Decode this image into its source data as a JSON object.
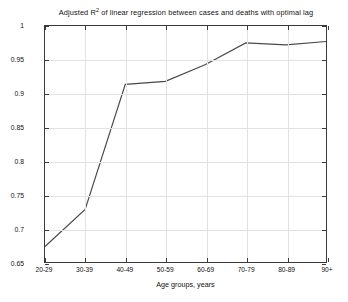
{
  "chart_data": {
    "type": "line",
    "title": "Adjusted R2 of linear regression between cases and deaths with optimal lag",
    "title_prefix": "Adjusted R",
    "title_superscript": "2",
    "title_suffix": " of linear regression between cases and deaths with optimal lag",
    "xlabel": "Age groups, years",
    "ylabel": "",
    "categories": [
      "20-29",
      "30-39",
      "40-49",
      "50-59",
      "60-69",
      "70-79",
      "80-89",
      "90+"
    ],
    "values": [
      0.673,
      0.728,
      0.9135,
      0.918,
      0.943,
      0.975,
      0.972,
      0.977
    ],
    "series": [
      {
        "name": "Adjusted R2",
        "values": [
          0.673,
          0.728,
          0.9135,
          0.918,
          0.943,
          0.975,
          0.972,
          0.977
        ]
      }
    ],
    "ylim": [
      0.65,
      1.0
    ],
    "yticks": [
      0.65,
      0.7,
      0.75,
      0.8,
      0.85,
      0.9,
      0.95,
      1
    ],
    "ytick_labels": [
      "0.65",
      "0.7",
      "0.75",
      "0.8",
      "0.85",
      "0.9",
      "0.95",
      "1"
    ],
    "xticks": [
      "20-29",
      "30-39",
      "40-49",
      "50-59",
      "60-69",
      "70-79",
      "80-89",
      "90+"
    ],
    "grid": true,
    "legend": null,
    "legend_position": "none",
    "line_color": "#4a4a4a",
    "line_width": 1.2,
    "markers": false,
    "background_color": "#ffffff",
    "axis_color": "#3a3a3a",
    "grid_color": "#e2e2e2"
  }
}
